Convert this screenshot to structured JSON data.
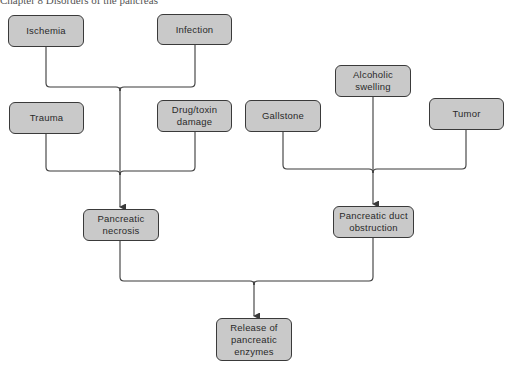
{
  "header": {
    "cropped_text": "Chapter 8 Disorders of the pancreas"
  },
  "diagram": {
    "colors": {
      "box_fill": "#c9c9c9",
      "box_border": "#3a3a3a",
      "line": "#3a3a3a",
      "text": "#2a2a2a"
    },
    "nodes": {
      "ischemia": "Ischemia",
      "infection": "Infection",
      "trauma": "Trauma",
      "drug_toxin": "Drug/toxin\ndamage",
      "gallstone": "Gallstone",
      "alcoholic_swelling": "Alcoholic\nswelling",
      "tumor": "Tumor",
      "pancreatic_necrosis": "Pancreatic\nnecrosis",
      "duct_obstruction": "Pancreatic duct\nobstruction",
      "release_enzymes": "Release of\npancreatic\nenzymes"
    },
    "edges": [
      {
        "from": "ischemia",
        "to": "pancreatic_necrosis"
      },
      {
        "from": "infection",
        "to": "pancreatic_necrosis"
      },
      {
        "from": "trauma",
        "to": "pancreatic_necrosis"
      },
      {
        "from": "drug_toxin",
        "to": "pancreatic_necrosis"
      },
      {
        "from": "gallstone",
        "to": "duct_obstruction"
      },
      {
        "from": "alcoholic_swelling",
        "to": "duct_obstruction"
      },
      {
        "from": "tumor",
        "to": "duct_obstruction"
      },
      {
        "from": "pancreatic_necrosis",
        "to": "release_enzymes"
      },
      {
        "from": "duct_obstruction",
        "to": "release_enzymes"
      }
    ]
  }
}
